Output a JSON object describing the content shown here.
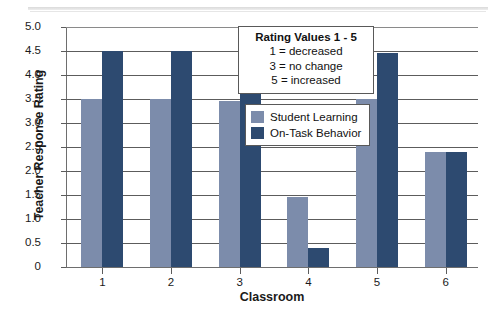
{
  "chart_data": {
    "type": "bar",
    "title": "",
    "xlabel": "Classroom",
    "ylabel": "Teacher Response Rating",
    "categories": [
      "1",
      "2",
      "3",
      "4",
      "5",
      "6"
    ],
    "series": [
      {
        "name": "Student Learning",
        "color": "#7c8cab",
        "values": [
          3.5,
          3.5,
          3.45,
          1.45,
          3.5,
          2.4
        ]
      },
      {
        "name": "On-Task Behavior",
        "color": "#2d4a70",
        "values": [
          4.5,
          4.5,
          4.5,
          0.4,
          4.45,
          2.4
        ]
      }
    ],
    "ylim": [
      0,
      5
    ],
    "ytick_labels": [
      "5.0",
      "4.5",
      "4.0",
      "3.5",
      "3.0",
      "2.5",
      "2.0",
      "1.5",
      "1.0",
      "0.5",
      "0"
    ],
    "ytick_values": [
      5.0,
      4.5,
      4.0,
      3.5,
      3.0,
      2.5,
      2.0,
      1.5,
      1.0,
      0.5,
      0
    ],
    "grid": true,
    "legend_position": "inside-upper-right",
    "annotation": {
      "title": "Rating Values 1 - 5",
      "lines": [
        "1 = decreased",
        "3 = no change",
        "5 = increased"
      ]
    }
  }
}
